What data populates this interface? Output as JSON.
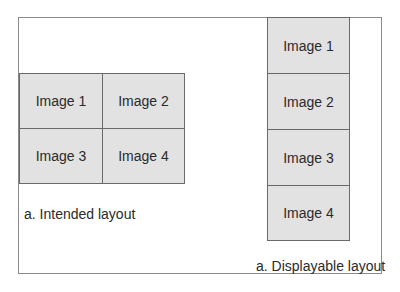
{
  "intended": {
    "caption": "a. Intended layout",
    "cells": [
      "Image 1",
      "Image 2",
      "Image 3",
      "Image 4"
    ]
  },
  "displayable": {
    "caption": "a. Displayable layout",
    "cells": [
      "Image 1",
      "Image 2",
      "Image 3",
      "Image 4"
    ]
  },
  "colors": {
    "cell_fill": "#e2e2e2",
    "cell_border": "#6a6a6a",
    "frame_border": "#8a8a8a"
  }
}
